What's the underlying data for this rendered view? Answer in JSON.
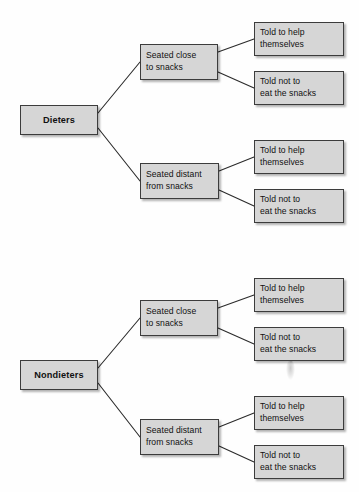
{
  "diagram": {
    "type": "tree-diagram",
    "title": "",
    "background_color": "#fefefe",
    "node_fill_color": "#d6d6d6",
    "node_border_color": "#3c3c3c",
    "edge_color": "#2b2b2b",
    "text_color": "#111111",
    "trees": [
      {
        "id": "dieters-tree",
        "root": {
          "label": "Dieters"
        },
        "branches": [
          {
            "label": "Seated close\nto snacks",
            "leaves": [
              {
                "label": "Told to help\nthemselves"
              },
              {
                "label": "Told not to\neat the snacks"
              }
            ]
          },
          {
            "label": "Seated distant\nfrom snacks",
            "leaves": [
              {
                "label": "Told to help\nthemselves"
              },
              {
                "label": "Told not to\neat the snacks"
              }
            ]
          }
        ]
      },
      {
        "id": "nondieters-tree",
        "root": {
          "label": "Nondieters"
        },
        "branches": [
          {
            "label": "Seated close\nto snacks",
            "leaves": [
              {
                "label": "Told to help\nthemselves"
              },
              {
                "label": "Told not to\neat the snacks"
              }
            ]
          },
          {
            "label": "Seated distant\nfrom snacks",
            "leaves": [
              {
                "label": "Told to help\nthemselves"
              },
              {
                "label": "Told not to\neat the snacks"
              }
            ]
          }
        ]
      }
    ]
  }
}
